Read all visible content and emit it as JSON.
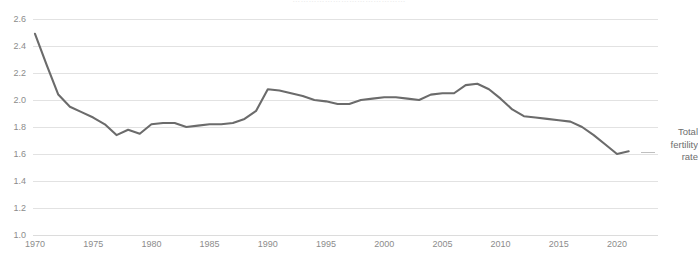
{
  "caption": {
    "text": "……………………………………",
    "note": "cut-off caption row at top edge of screenshot (illegible)"
  },
  "legend": {
    "line1": "Total",
    "line2": "fertility",
    "line3": "rate"
  },
  "colors": {
    "series_line": "#6b6b6b",
    "gridline": "#e2e2e2",
    "tick_label": "#8c8c8c",
    "legend_text": "#6e6e6e",
    "background": "#ffffff"
  },
  "chart_data": {
    "type": "line",
    "title": "",
    "xlabel": "",
    "ylabel": "",
    "xlim": [
      1970,
      2021
    ],
    "ylim": [
      1.0,
      2.6
    ],
    "grid": true,
    "legend_position": "right",
    "xticks": [
      1970,
      1975,
      1980,
      1985,
      1990,
      1995,
      2000,
      2005,
      2010,
      2015,
      2020
    ],
    "yticks": [
      1.0,
      1.2,
      1.4,
      1.6,
      1.8,
      2.0,
      2.2,
      2.4,
      2.6
    ],
    "ytick_labels": [
      "1.0",
      "1.2",
      "1.4",
      "1.6",
      "1.8",
      "2.0",
      "2.2",
      "2.4",
      "2.6"
    ],
    "xtick_labels": [
      "1970",
      "1975",
      "1980",
      "1985",
      "1990",
      "1995",
      "2000",
      "2005",
      "2010",
      "2015",
      "2020"
    ],
    "series": [
      {
        "name": "Total fertility rate",
        "color": "#6b6b6b",
        "x": [
          1970,
          1971,
          1972,
          1973,
          1974,
          1975,
          1976,
          1977,
          1978,
          1979,
          1980,
          1981,
          1982,
          1983,
          1984,
          1985,
          1986,
          1987,
          1988,
          1989,
          1990,
          1991,
          1992,
          1993,
          1994,
          1995,
          1996,
          1997,
          1998,
          1999,
          2000,
          2001,
          2002,
          2003,
          2004,
          2005,
          2006,
          2007,
          2008,
          2009,
          2010,
          2011,
          2012,
          2013,
          2014,
          2015,
          2016,
          2017,
          2018,
          2019,
          2020,
          2021
        ],
        "values": [
          2.49,
          2.26,
          2.04,
          1.95,
          1.91,
          1.87,
          1.82,
          1.74,
          1.78,
          1.75,
          1.82,
          1.83,
          1.83,
          1.8,
          1.81,
          1.82,
          1.82,
          1.83,
          1.86,
          1.92,
          2.08,
          2.07,
          2.05,
          2.03,
          2.0,
          1.99,
          1.97,
          1.97,
          2.0,
          2.01,
          2.02,
          2.02,
          2.01,
          2.0,
          2.04,
          2.05,
          2.05,
          2.11,
          2.12,
          2.08,
          2.01,
          1.93,
          1.88,
          1.87,
          1.86,
          1.85,
          1.84,
          1.8,
          1.74,
          1.67,
          1.6,
          1.62
        ]
      }
    ]
  }
}
